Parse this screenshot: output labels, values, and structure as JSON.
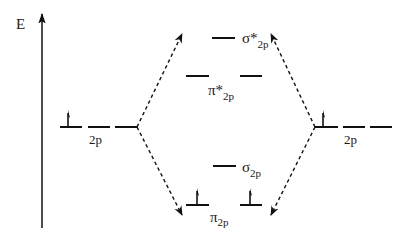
{
  "diagram": {
    "type": "molecular-orbital-energy-diagram",
    "axis": {
      "label": "E"
    },
    "left_atom": {
      "orbital_label": "2p",
      "orbital_count": 3,
      "electrons": [
        "up",
        "none",
        "none"
      ]
    },
    "right_atom": {
      "orbital_label": "2p",
      "orbital_count": 3,
      "electrons": [
        "up",
        "none",
        "none"
      ]
    },
    "molecular_orbitals": [
      {
        "id": "sigma-star-2p",
        "symbol": "σ*",
        "subscript": "2p",
        "degeneracy": 1,
        "electrons": [
          "none"
        ]
      },
      {
        "id": "pi-star-2p",
        "symbol": "π*",
        "subscript": "2p",
        "degeneracy": 2,
        "electrons": [
          "none",
          "none"
        ]
      },
      {
        "id": "sigma-2p",
        "symbol": "σ",
        "subscript": "2p",
        "degeneracy": 1,
        "electrons": [
          "none"
        ]
      },
      {
        "id": "pi-2p",
        "symbol": "π",
        "subscript": "2p",
        "degeneracy": 2,
        "electrons": [
          "up",
          "up"
        ]
      }
    ],
    "connectors": [
      {
        "from": "left-2p",
        "to": "antibonding",
        "style": "dashed-arrow"
      },
      {
        "from": "left-2p",
        "to": "bonding",
        "style": "dashed-arrow"
      },
      {
        "from": "right-2p",
        "to": "antibonding",
        "style": "dashed-arrow"
      },
      {
        "from": "right-2p",
        "to": "bonding",
        "style": "dashed-arrow"
      }
    ]
  }
}
